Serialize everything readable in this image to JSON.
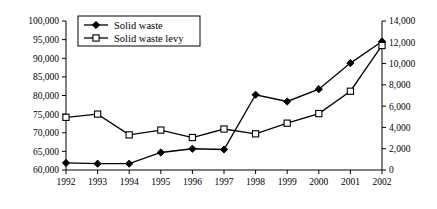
{
  "chart_data": {
    "type": "line",
    "title": "",
    "subtitle": "",
    "xlabel": "",
    "ylabel": "",
    "y2label": "",
    "grid": false,
    "legend_position": "top-left",
    "categories": [
      "1992",
      "1993",
      "1994",
      "1995",
      "1996",
      "1997",
      "1998",
      "1999",
      "2000",
      "2001",
      "2002"
    ],
    "xlim": [
      1992,
      2002
    ],
    "ylim": [
      60000,
      100000
    ],
    "y2lim": [
      0,
      14000
    ],
    "y_ticks": [
      "60,000",
      "65,000",
      "70,000",
      "75,000",
      "80,000",
      "85,000",
      "90,000",
      "95,000",
      "100,000"
    ],
    "y_tick_values": [
      60000,
      65000,
      70000,
      75000,
      80000,
      85000,
      90000,
      95000,
      100000
    ],
    "y2_ticks": [
      "0",
      "2,000",
      "4,000",
      "6,000",
      "8,000",
      "10,000",
      "12,000",
      "14,000"
    ],
    "y2_tick_values": [
      0,
      2000,
      4000,
      6000,
      8000,
      10000,
      12000,
      14000
    ],
    "series": [
      {
        "name": "Solid waste",
        "axis": "left",
        "marker": "filled-diamond",
        "color": "#000000",
        "values": [
          61900,
          61700,
          61700,
          64700,
          65700,
          65500,
          80200,
          78400,
          81700,
          88700,
          94500
        ]
      },
      {
        "name": "Solid waste levy",
        "axis": "right",
        "marker": "open-square",
        "color": "#000000",
        "values": [
          4950,
          5250,
          3300,
          3750,
          3050,
          3850,
          3400,
          4400,
          5300,
          7400,
          11700
        ]
      }
    ]
  },
  "legend": {
    "entries": [
      {
        "label": "Solid waste",
        "marker": "filled-diamond"
      },
      {
        "label": "Solid waste levy",
        "marker": "open-square"
      }
    ]
  }
}
